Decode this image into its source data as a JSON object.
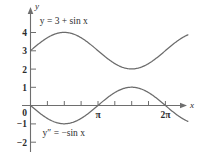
{
  "figure": {
    "background_color": "#ffffff",
    "axis_color": "#6e6e6e",
    "curve_color": "#6b6b6b",
    "text_color": "#2b2b2b"
  },
  "axes": {
    "x_axis_label": "x",
    "y_axis_label": "y",
    "x_tick_labels": [
      {
        "text": "π",
        "value": 3.14159
      },
      {
        "text": "2π",
        "value": 6.28319
      }
    ],
    "y_tick_labels": [
      {
        "text": "4",
        "value": 4
      },
      {
        "text": "3",
        "value": 3
      },
      {
        "text": "2",
        "value": 2
      },
      {
        "text": "1",
        "value": 1
      },
      {
        "text": "0",
        "value": 0
      },
      {
        "text": "−1",
        "value": -1
      },
      {
        "text": "−2",
        "value": -2
      }
    ]
  },
  "labels": {
    "upper_curve": "y = 3 + sin x",
    "lower_curve": "y″ = −sin x"
  },
  "chart_data": {
    "type": "line",
    "title": "",
    "xlabel": "x",
    "ylabel": "y",
    "xlim": [
      -0.25,
      7.4
    ],
    "ylim": [
      -2.4,
      4.6
    ],
    "grid": false,
    "legend": "inline-annotations",
    "x_ticks": [
      0,
      0.7854,
      1.5708,
      2.3562,
      3.14159,
      3.92699,
      4.71239,
      5.49779,
      6.28319
    ],
    "x_tick_text": [
      "",
      "",
      "",
      "",
      "π",
      "",
      "",
      "",
      "2π"
    ],
    "y_ticks": [
      -2,
      -1,
      0,
      1,
      2,
      3,
      4
    ],
    "series": [
      {
        "name": "y = 3 + sin x",
        "expression": "3 + sin(x)",
        "x": [
          0,
          0.3927,
          0.7854,
          1.1781,
          1.5708,
          1.9635,
          2.3562,
          2.7489,
          3.14159,
          3.5343,
          3.927,
          4.3197,
          4.7124,
          5.1051,
          5.4978,
          5.8905,
          6.2832,
          6.675,
          7.068,
          7.33
        ],
        "y": [
          3.0,
          3.383,
          3.707,
          3.924,
          4.0,
          3.924,
          3.707,
          3.383,
          3.0,
          2.617,
          2.293,
          2.076,
          2.0,
          2.076,
          2.293,
          2.617,
          3.0,
          3.383,
          3.707,
          3.85
        ],
        "annotation": "y = 3 + sin x",
        "annotation_x": 1.55,
        "annotation_y": 4.45
      },
      {
        "name": "y″ = −sin x",
        "expression": "-sin(x)",
        "x": [
          0,
          0.3927,
          0.7854,
          1.1781,
          1.5708,
          1.9635,
          2.3562,
          2.7489,
          3.14159,
          3.5343,
          3.927,
          4.3197,
          4.7124,
          5.1051,
          5.4978,
          5.8905,
          6.2832,
          6.675,
          7.068,
          7.33
        ],
        "y": [
          0.0,
          -0.383,
          -0.707,
          -0.924,
          -1.0,
          -0.924,
          -0.707,
          -0.383,
          0.0,
          0.383,
          0.707,
          0.924,
          1.0,
          0.924,
          0.707,
          0.383,
          0.0,
          -0.383,
          -0.707,
          -0.851
        ],
        "annotation": "y″ = −sin x",
        "annotation_x": 1.55,
        "annotation_y": -1.65
      }
    ]
  }
}
